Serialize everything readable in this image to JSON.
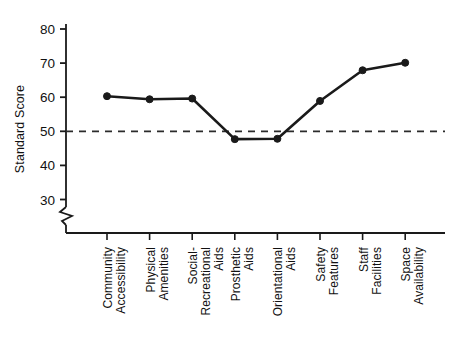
{
  "chart_data": {
    "type": "line",
    "title": "",
    "xlabel": "",
    "ylabel": "Standard Score",
    "ylim": [
      25,
      82
    ],
    "yticks": [
      30,
      40,
      50,
      60,
      70,
      80
    ],
    "ytick_labels": [
      "30",
      "40",
      "50",
      "60",
      "70",
      "80"
    ],
    "grid": false,
    "legend": "none",
    "axis_break": true,
    "axis_break_note": "zigzag break on y-axis below 30",
    "reference_line": {
      "value": 50,
      "label": "",
      "style": "dashed"
    },
    "categories": [
      "Community Accessibility",
      "Physical Amenities",
      "Social-Recreational Aids",
      "Prosthetic Aids",
      "Orientational Aids",
      "Safety Features",
      "Staff Facilities",
      "Space Availability"
    ],
    "category_lines": [
      [
        "Community",
        "Accessibility"
      ],
      [
        "Physical",
        "Amenities"
      ],
      [
        "Social-",
        "Recreational",
        "Aids"
      ],
      [
        "Prosthetic",
        "Aids"
      ],
      [
        "Orientational",
        "Aids"
      ],
      [
        "Safety",
        "Features"
      ],
      [
        "Staff",
        "Facilities"
      ],
      [
        "Space",
        "Availability"
      ]
    ],
    "values": [
      60.3,
      59.4,
      59.6,
      47.7,
      47.8,
      58.9,
      67.9,
      70.1
    ],
    "series_name": "Standard Score",
    "marker": "filled-circle",
    "line_color": "#1a1a1a",
    "marker_color": "#1a1a1a",
    "reference_color": "#2b2b2b",
    "axis_color": "#1a1a1a",
    "background_color": "#ffffff"
  },
  "axis": {
    "y_label": "Standard Score"
  }
}
